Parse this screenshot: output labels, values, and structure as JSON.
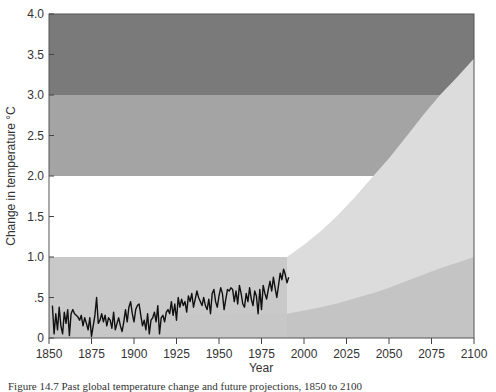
{
  "chart_data": {
    "type": "line",
    "title": "",
    "xlabel": "Year",
    "ylabel": "Change in temperature °C",
    "xlim": [
      1850,
      2100
    ],
    "ylim": [
      0,
      4.0
    ],
    "x_ticks": [
      1850,
      1875,
      1900,
      1925,
      1950,
      1975,
      2000,
      2025,
      2050,
      2075,
      2100
    ],
    "x_tick_labels": [
      "1850",
      "1875",
      "1900",
      "1925",
      "1950",
      "1975",
      "2000",
      "2025",
      "2050",
      "2075",
      "2100"
    ],
    "y_ticks": [
      0,
      0.5,
      1.0,
      1.5,
      2.0,
      2.5,
      3.0,
      3.5,
      4.0
    ],
    "y_tick_labels": [
      "0",
      ".5",
      "1.0",
      "1.5",
      "2.0",
      "2.5",
      "3.0",
      "3.5",
      "4.0"
    ],
    "grid": false,
    "legend": null,
    "background_bands": [
      {
        "from": 0.0,
        "to": 1.0,
        "color": "#c9c9c9"
      },
      {
        "from": 1.0,
        "to": 2.0,
        "color": "#ffffff"
      },
      {
        "from": 2.0,
        "to": 3.0,
        "color": "#a4a4a4"
      },
      {
        "from": 3.0,
        "to": 4.0,
        "color": "#7a7a7a"
      }
    ],
    "series": [
      {
        "name": "Observed temperature change",
        "color": "#111111",
        "x": [
          1852,
          1853,
          1854,
          1855,
          1856,
          1857,
          1858,
          1859,
          1860,
          1861,
          1862,
          1863,
          1864,
          1865,
          1866,
          1867,
          1868,
          1869,
          1870,
          1871,
          1872,
          1873,
          1874,
          1875,
          1876,
          1877,
          1878,
          1879,
          1880,
          1881,
          1882,
          1883,
          1884,
          1885,
          1886,
          1887,
          1888,
          1889,
          1890,
          1891,
          1892,
          1893,
          1894,
          1895,
          1896,
          1897,
          1898,
          1899,
          1900,
          1901,
          1902,
          1903,
          1904,
          1905,
          1906,
          1907,
          1908,
          1909,
          1910,
          1911,
          1912,
          1913,
          1914,
          1915,
          1916,
          1917,
          1918,
          1919,
          1920,
          1921,
          1922,
          1923,
          1924,
          1925,
          1926,
          1927,
          1928,
          1929,
          1930,
          1931,
          1932,
          1933,
          1934,
          1935,
          1936,
          1937,
          1938,
          1939,
          1940,
          1941,
          1942,
          1943,
          1944,
          1945,
          1946,
          1947,
          1948,
          1949,
          1950,
          1951,
          1952,
          1953,
          1954,
          1955,
          1956,
          1957,
          1958,
          1959,
          1960,
          1961,
          1962,
          1963,
          1964,
          1965,
          1966,
          1967,
          1968,
          1969,
          1970,
          1971,
          1972,
          1973,
          1974,
          1975,
          1976,
          1977,
          1978,
          1979,
          1980,
          1981,
          1982,
          1983,
          1984,
          1985,
          1986,
          1987,
          1988,
          1989,
          1990,
          1991
        ],
        "values": [
          0.4,
          0.05,
          0.3,
          0.1,
          0.38,
          0.15,
          0.05,
          0.32,
          0.18,
          0.35,
          0.03,
          0.3,
          0.35,
          0.3,
          0.28,
          0.26,
          0.22,
          0.28,
          0.15,
          0.25,
          0.18,
          0.1,
          0.25,
          0.02,
          0.15,
          0.28,
          0.5,
          0.18,
          0.22,
          0.3,
          0.2,
          0.28,
          0.15,
          0.25,
          0.22,
          0.12,
          0.32,
          0.1,
          0.18,
          0.25,
          0.15,
          0.08,
          0.2,
          0.35,
          0.2,
          0.38,
          0.45,
          0.3,
          0.2,
          0.35,
          0.4,
          0.42,
          0.28,
          0.15,
          0.22,
          0.1,
          0.3,
          0.05,
          0.22,
          0.25,
          0.32,
          0.2,
          0.4,
          0.05,
          0.25,
          0.28,
          0.2,
          0.32,
          0.35,
          0.3,
          0.45,
          0.28,
          0.42,
          0.22,
          0.5,
          0.38,
          0.48,
          0.4,
          0.45,
          0.32,
          0.52,
          0.45,
          0.55,
          0.38,
          0.48,
          0.58,
          0.5,
          0.45,
          0.4,
          0.5,
          0.4,
          0.35,
          0.48,
          0.3,
          0.55,
          0.6,
          0.45,
          0.38,
          0.52,
          0.62,
          0.55,
          0.35,
          0.48,
          0.6,
          0.58,
          0.62,
          0.6,
          0.45,
          0.58,
          0.42,
          0.65,
          0.55,
          0.42,
          0.38,
          0.55,
          0.45,
          0.62,
          0.48,
          0.4,
          0.58,
          0.52,
          0.3,
          0.6,
          0.35,
          0.65,
          0.55,
          0.48,
          0.6,
          0.7,
          0.58,
          0.75,
          0.62,
          0.5,
          0.65,
          0.8,
          0.72,
          0.85,
          0.78,
          0.68,
          0.75
        ]
      }
    ],
    "projection": {
      "start_year": 1990,
      "end_year": 2100,
      "upper": {
        "x": [
          1990,
          2000,
          2010,
          2020,
          2030,
          2040,
          2050,
          2060,
          2070,
          2080,
          2090,
          2100
        ],
        "values": [
          1.0,
          1.15,
          1.32,
          1.52,
          1.74,
          1.98,
          2.22,
          2.48,
          2.75,
          3.0,
          3.22,
          3.45
        ]
      },
      "lower": {
        "x": [
          1990,
          2000,
          2010,
          2020,
          2030,
          2040,
          2050,
          2060,
          2070,
          2080,
          2090,
          2100
        ],
        "values": [
          0.3,
          0.34,
          0.38,
          0.43,
          0.49,
          0.55,
          0.62,
          0.7,
          0.78,
          0.86,
          0.93,
          1.0
        ]
      },
      "upper_fill_color": "#dcdcdc",
      "lower_fill_color": "#c4c4c4"
    }
  },
  "caption": {
    "text": "Figure 14.7    Past global temperature change and future projections, 1850 to 2100"
  }
}
